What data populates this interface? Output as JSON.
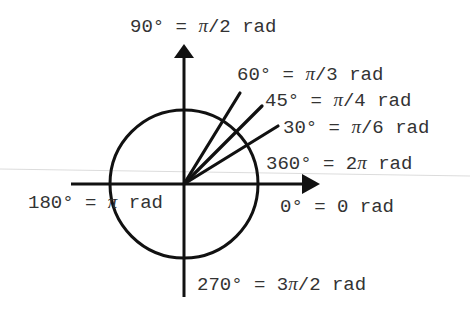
{
  "diagram": {
    "type": "unit-circle-angle-conversions",
    "colors": {
      "stroke": "#111111",
      "text": "#333333",
      "scan_line": "#d8d8d8",
      "background": "#ffffff"
    },
    "geometry": {
      "center": [
        184,
        184
      ],
      "radius": 74
    },
    "labels": {
      "deg90": {
        "deg": "90°",
        "eq": " = ",
        "pi": "π",
        "rest": "/2 rad",
        "pre": ""
      },
      "deg60": {
        "deg": "60°",
        "eq": " = ",
        "pi": "π",
        "rest": "/3 rad",
        "pre": ""
      },
      "deg45": {
        "deg": "45°",
        "eq": " = ",
        "pi": "π",
        "rest": "/4 rad",
        "pre": ""
      },
      "deg30": {
        "deg": "30°",
        "eq": " = ",
        "pi": "π",
        "rest": "/6 rad",
        "pre": ""
      },
      "deg360": {
        "deg": "360°",
        "eq": " = ",
        "pre": "2",
        "pi": "π",
        "rest": " rad"
      },
      "deg180": {
        "deg": "180°",
        "eq": " = ",
        "pre": "",
        "pi": "π",
        "rest": " rad"
      },
      "deg0": {
        "text": "0° = 0 rad"
      },
      "deg270": {
        "deg": "270°",
        "eq": " = ",
        "pre": "3",
        "pi": "π",
        "rest": "/2 rad"
      }
    },
    "rays": [
      {
        "name": "ray-60-degrees",
        "angle_deg": 60
      },
      {
        "name": "ray-45-degrees",
        "angle_deg": 45
      },
      {
        "name": "ray-30-degrees",
        "angle_deg": 30
      }
    ]
  }
}
